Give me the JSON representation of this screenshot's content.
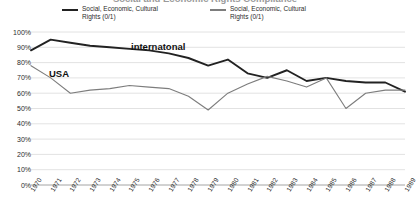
{
  "title": "Social and Economic Rights Compliance",
  "legend": {
    "position": "top",
    "entries": [
      {
        "label": "Social, Economic, Cultural Rights (0/1)",
        "color": "#222222",
        "swatch": "line-swatch-icon"
      },
      {
        "label": "Social, Economic, Cultural Rights (0/1)",
        "color": "#7d7d7d",
        "swatch": "line-swatch-icon"
      }
    ]
  },
  "annotations": [
    {
      "text": "internatonal",
      "series": "international"
    },
    {
      "text": "USA",
      "series": "usa"
    }
  ],
  "axes": {
    "y": {
      "ticks": [
        "100%",
        "90%",
        "80%",
        "70%",
        "60%",
        "50%",
        "40%",
        "30%",
        "20%",
        "10%",
        "0%"
      ],
      "min": 0,
      "max": 100
    },
    "x": {
      "ticks": [
        "1970",
        "1971",
        "1972",
        "1973",
        "1974",
        "1975",
        "1976",
        "1977",
        "1978",
        "1979",
        "1980",
        "1981",
        "1982",
        "1983",
        "1984",
        "1985",
        "1986",
        "1987",
        "1988",
        "1989"
      ]
    }
  },
  "chart_data": {
    "type": "line",
    "title": "Social and Economic Rights Compliance",
    "xlabel": "",
    "ylabel": "",
    "ylim": [
      0,
      100
    ],
    "grid": true,
    "legend_position": "top",
    "x": [
      1970,
      1971,
      1972,
      1973,
      1974,
      1975,
      1976,
      1977,
      1978,
      1979,
      1980,
      1981,
      1982,
      1983,
      1984,
      1985,
      1986,
      1987,
      1988,
      1989
    ],
    "categories": [
      "1970",
      "1971",
      "1972",
      "1973",
      "1974",
      "1975",
      "1976",
      "1977",
      "1978",
      "1979",
      "1980",
      "1981",
      "1982",
      "1983",
      "1984",
      "1985",
      "1986",
      "1987",
      "1988",
      "1989"
    ],
    "series": [
      {
        "name": "Social, Economic, Cultural Rights (0/1)",
        "annotation": "internatonal",
        "color": "#222222",
        "values": [
          88,
          95,
          93,
          91,
          90,
          89,
          88,
          86,
          83,
          78,
          82,
          73,
          70,
          75,
          68,
          70,
          68,
          67,
          67,
          61
        ]
      },
      {
        "name": "Social, Economic, Cultural Rights (0/1)",
        "annotation": "USA",
        "color": "#7d7d7d",
        "values": [
          78,
          70,
          60,
          62,
          63,
          65,
          64,
          63,
          58,
          49,
          60,
          66,
          71,
          68,
          64,
          70,
          50,
          60,
          62,
          62
        ]
      }
    ]
  }
}
